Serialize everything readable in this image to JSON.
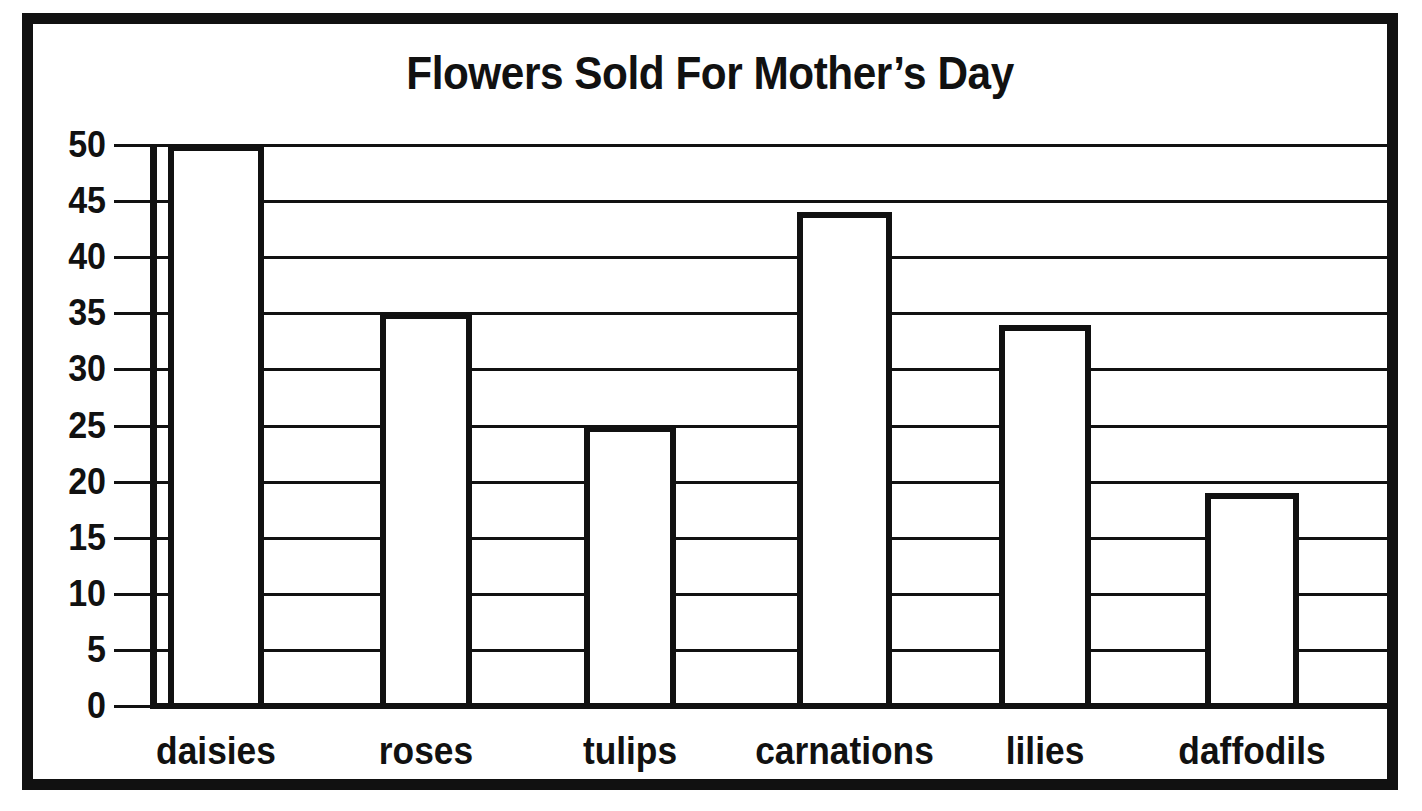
{
  "chart_data": {
    "type": "bar",
    "title": "Flowers Sold For Mother’s Day",
    "xlabel": "",
    "ylabel": "",
    "categories": [
      "daisies",
      "roses",
      "tulips",
      "carnations",
      "lilies",
      "daffodils"
    ],
    "values": [
      50,
      35,
      25,
      44,
      34,
      19
    ],
    "ylim": [
      0,
      50
    ],
    "yticks": [
      0,
      5,
      10,
      15,
      20,
      25,
      30,
      35,
      40,
      45,
      50
    ],
    "ytick_labels": [
      "0",
      "5",
      "10",
      "15",
      "20",
      "25",
      "30",
      "35",
      "40",
      "45",
      "50"
    ],
    "grid": true,
    "legend": false,
    "bar_fill_color": "#ffffff",
    "bar_edge_color": "#111111",
    "background_color": "#ffffff",
    "series": [
      {
        "name": "Flowers Sold",
        "values": [
          50,
          35,
          25,
          44,
          34,
          19
        ]
      }
    ]
  },
  "frame": {
    "border_color": "#111111"
  }
}
